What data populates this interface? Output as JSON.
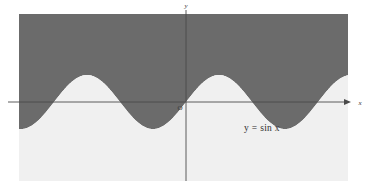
{
  "figure": {
    "background_color": "#ffffff",
    "plot": {
      "x0": 19,
      "y0": 14,
      "width": 329,
      "height": 167,
      "shade_above_color": "#6b6b6b",
      "shade_below_color": "#f0f0f0"
    },
    "axes": {
      "x_axis": {
        "label": "x",
        "name": "x-axis",
        "y_pixel": 102,
        "start_x": 8,
        "end_x": 348,
        "arrow": true,
        "color": "#4a4a4a"
      },
      "y_axis": {
        "label": "y",
        "name": "y-axis",
        "x_pixel": 186,
        "start_y": 10,
        "end_y": 181,
        "arrow": false,
        "color": "#4a4a4a"
      },
      "origin": {
        "label": "O",
        "x_pixel": 186,
        "y_pixel": 102
      }
    },
    "annotation": {
      "equation": "y = sin x",
      "x_pixel": 262,
      "y_pixel": 131
    }
  },
  "chart_data": {
    "type": "line",
    "title": "",
    "subtitle": "",
    "xlabel": "x",
    "ylabel": "y",
    "equation": "y = sin x",
    "function": "sin",
    "amplitude": 1,
    "period": 6.283185307179586,
    "phase": 0,
    "grid": false,
    "legend": null,
    "annotations": [
      "y = sin x",
      "O",
      "x",
      "y"
    ],
    "axis_origin_label": "O",
    "xlim": [
      -7.95,
      7.71
    ],
    "ylim": [
      -3.26,
      3.26
    ],
    "pixels": {
      "amplitude_px": 27,
      "period_px": 132,
      "axis_y_px": 102,
      "axis_x_px": 186
    },
    "x": [
      -7.95,
      -7.45,
      -6.95,
      -6.45,
      -5.95,
      -5.45,
      -4.95,
      -4.45,
      -3.95,
      -3.45,
      -2.95,
      -2.45,
      -1.95,
      -1.45,
      -0.95,
      -0.45,
      0.0,
      0.45,
      0.95,
      1.45,
      1.95,
      2.45,
      2.95,
      3.45,
      3.95,
      4.45,
      4.95,
      5.45,
      5.95,
      6.45,
      6.95,
      7.45,
      7.71
    ],
    "y": [
      -0.99,
      -0.91,
      -0.62,
      -0.17,
      0.34,
      0.74,
      0.97,
      0.97,
      0.73,
      0.3,
      -0.19,
      -0.64,
      -0.93,
      -0.99,
      -0.81,
      -0.43,
      0.0,
      0.43,
      0.81,
      0.99,
      0.93,
      0.64,
      0.19,
      -0.3,
      -0.73,
      -0.97,
      -0.97,
      -0.74,
      -0.34,
      0.17,
      0.62,
      0.91,
      0.99
    ],
    "fill_regions": [
      {
        "name": "above-curve",
        "color": "#6b6b6b",
        "description": "region above y = sin x"
      },
      {
        "name": "below-curve",
        "color": "#f0f0f0",
        "description": "region below y = sin x"
      }
    ]
  }
}
